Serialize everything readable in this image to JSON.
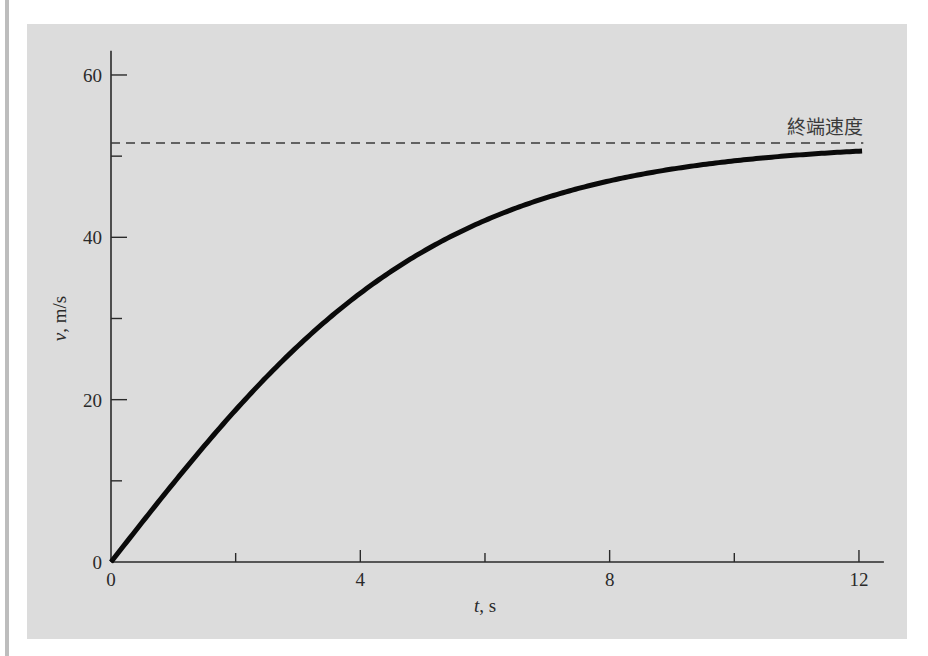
{
  "chart_data": {
    "type": "line",
    "title": "",
    "xlabel": "t, s",
    "ylabel": "v, m/s",
    "xlim": [
      0,
      12.4
    ],
    "ylim": [
      0,
      63
    ],
    "grid": false,
    "x_ticks": [
      0,
      2,
      4,
      6,
      8,
      10,
      12
    ],
    "x_tick_labels": [
      "0",
      "",
      "4",
      "",
      "8",
      "",
      "12"
    ],
    "y_ticks": [
      0,
      10,
      20,
      30,
      40,
      50,
      60
    ],
    "y_tick_labels": [
      "0",
      "",
      "20",
      "",
      "40",
      "",
      "60"
    ],
    "series": [
      {
        "name": "velocity",
        "style": "solid-thick",
        "x": [
          0,
          1,
          2,
          3,
          4,
          5,
          6,
          7,
          8,
          9,
          10,
          11,
          12
        ],
        "values": [
          0,
          9.69,
          18.73,
          26.61,
          33.12,
          38.22,
          42.07,
          44.91,
          46.96,
          48.4,
          49.42,
          50.13,
          50.62
        ]
      },
      {
        "name": "terminal-velocity",
        "style": "dashed",
        "value": 51.69
      }
    ],
    "annotations": [
      {
        "text": "終端速度",
        "anchor": "terminal-velocity",
        "position": "above-right"
      }
    ],
    "model": {
      "vt": 51.6938,
      "k": 0.189772
    }
  },
  "labels": {
    "x_axis": {
      "italic": "t",
      "rest": ", s"
    },
    "y_axis": {
      "italic": "v",
      "rest": ", m/s"
    },
    "annotation": "終端速度"
  },
  "colors": {
    "panel": "#dcdcdc",
    "ink": "#2a2a2a",
    "curve": "#0a0a0a"
  }
}
